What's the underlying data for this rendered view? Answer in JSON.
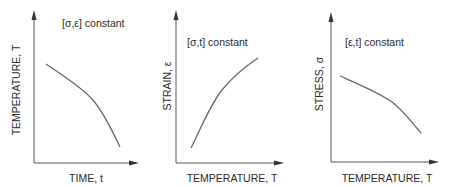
{
  "panels": [
    {
      "annotation": "[σ,ε] constant",
      "xlabel": "TIME, t",
      "ylabel": "TEMPERATURE, T",
      "trend": "decreasing, accelerating downward"
    },
    {
      "annotation": "[σ,t] constant",
      "xlabel": "TEMPERATURE, T",
      "ylabel": "STRAIN, ε",
      "trend": "increasing, concave down"
    },
    {
      "annotation": "[ε,t] constant",
      "xlabel": "TEMPERATURE, T",
      "ylabel": "STRESS, σ",
      "trend": "decreasing, accelerating downward"
    }
  ],
  "colors": {
    "axis": "#555555",
    "curve": "#666666",
    "text": "#2a2a2a"
  }
}
